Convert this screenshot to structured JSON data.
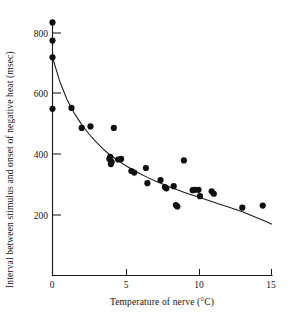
{
  "chart_data": {
    "type": "scatter",
    "title": "",
    "xlabel": "Temperature of nerve (°C)",
    "ylabel": "Interval between stimulus and onset of negative heat (msec)",
    "xlim": [
      0,
      15
    ],
    "ylim": [
      0,
      860
    ],
    "xticks": [
      0,
      5,
      10,
      15
    ],
    "xticklabels": [
      "0",
      "5",
      "10",
      "15"
    ],
    "yticks": [
      200,
      400,
      600,
      800
    ],
    "yticklabels": [
      "200",
      "400",
      "600",
      "800"
    ],
    "grid": false,
    "legend": null,
    "marker": "filled-circle",
    "points": [
      {
        "x": 0.0,
        "y": 835
      },
      {
        "x": 0.0,
        "y": 775
      },
      {
        "x": 0.0,
        "y": 720
      },
      {
        "x": 0.0,
        "y": 550
      },
      {
        "x": 1.3,
        "y": 553
      },
      {
        "x": 2.0,
        "y": 487
      },
      {
        "x": 2.6,
        "y": 492
      },
      {
        "x": 3.9,
        "y": 385
      },
      {
        "x": 3.95,
        "y": 392
      },
      {
        "x": 4.0,
        "y": 368
      },
      {
        "x": 4.05,
        "y": 375
      },
      {
        "x": 4.2,
        "y": 487
      },
      {
        "x": 4.5,
        "y": 383
      },
      {
        "x": 4.7,
        "y": 385
      },
      {
        "x": 5.4,
        "y": 345
      },
      {
        "x": 5.6,
        "y": 340
      },
      {
        "x": 6.4,
        "y": 355
      },
      {
        "x": 6.5,
        "y": 305
      },
      {
        "x": 7.4,
        "y": 315
      },
      {
        "x": 7.7,
        "y": 292
      },
      {
        "x": 7.8,
        "y": 288
      },
      {
        "x": 8.3,
        "y": 295
      },
      {
        "x": 8.45,
        "y": 233
      },
      {
        "x": 8.55,
        "y": 228
      },
      {
        "x": 9.0,
        "y": 380
      },
      {
        "x": 9.6,
        "y": 282
      },
      {
        "x": 9.75,
        "y": 283
      },
      {
        "x": 10.0,
        "y": 283
      },
      {
        "x": 10.1,
        "y": 262
      },
      {
        "x": 10.9,
        "y": 278
      },
      {
        "x": 11.05,
        "y": 270
      },
      {
        "x": 13.0,
        "y": 224
      },
      {
        "x": 14.4,
        "y": 231
      }
    ],
    "fit_curve": {
      "description": "monotonic decaying fit line",
      "points": [
        {
          "x": 0.0,
          "y": 720
        },
        {
          "x": 0.5,
          "y": 640
        },
        {
          "x": 1.0,
          "y": 580
        },
        {
          "x": 1.5,
          "y": 535
        },
        {
          "x": 2.0,
          "y": 498
        },
        {
          "x": 2.5,
          "y": 467
        },
        {
          "x": 3.0,
          "y": 440
        },
        {
          "x": 3.5,
          "y": 416
        },
        {
          "x": 4.0,
          "y": 396
        },
        {
          "x": 4.5,
          "y": 379
        },
        {
          "x": 5.0,
          "y": 363
        },
        {
          "x": 5.5,
          "y": 349
        },
        {
          "x": 6.0,
          "y": 336
        },
        {
          "x": 6.5,
          "y": 324
        },
        {
          "x": 7.0,
          "y": 313
        },
        {
          "x": 7.5,
          "y": 303
        },
        {
          "x": 8.0,
          "y": 293
        },
        {
          "x": 8.5,
          "y": 284
        },
        {
          "x": 9.0,
          "y": 275
        },
        {
          "x": 9.5,
          "y": 267
        },
        {
          "x": 10.0,
          "y": 259
        },
        {
          "x": 10.5,
          "y": 251
        },
        {
          "x": 11.0,
          "y": 243
        },
        {
          "x": 11.5,
          "y": 235
        },
        {
          "x": 12.0,
          "y": 227
        },
        {
          "x": 12.5,
          "y": 219
        },
        {
          "x": 13.0,
          "y": 211
        },
        {
          "x": 13.5,
          "y": 201
        },
        {
          "x": 14.0,
          "y": 191
        },
        {
          "x": 14.5,
          "y": 181
        },
        {
          "x": 15.0,
          "y": 170
        }
      ]
    }
  }
}
